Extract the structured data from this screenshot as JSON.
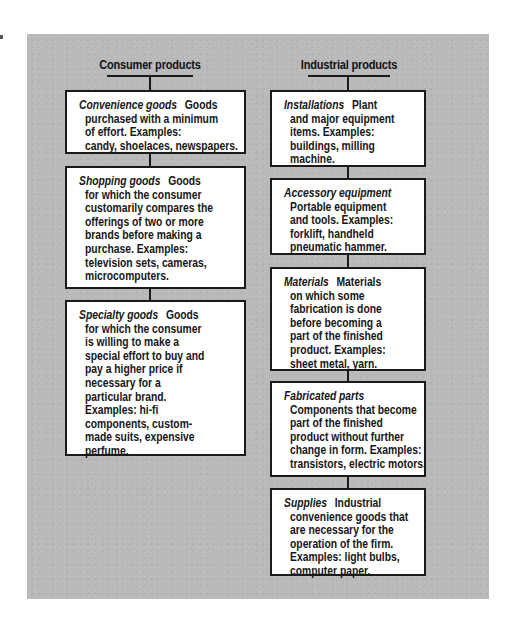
{
  "columns": [
    {
      "header": "Consumer products",
      "items": [
        {
          "term": "Convenience goods",
          "first_line_rest": "Goods",
          "lines": [
            "purchased with a minimum",
            "of effort. Examples:",
            "candy, shoelaces, newspapers."
          ]
        },
        {
          "term": "Shopping goods",
          "first_line_rest": "Goods",
          "lines": [
            "for which the consumer",
            "customarily compares the",
            "offerings of two or more",
            "brands before making a",
            "purchase. Examples:",
            "television sets, cameras,",
            "microcomputers."
          ]
        },
        {
          "term": "Specialty goods",
          "first_line_rest": "Goods",
          "lines": [
            "for which the consumer",
            "is willing to make a",
            "special effort to buy and",
            "pay a higher price if",
            "necessary for a",
            "particular brand.",
            "Examples: hi-fi",
            "components, custom-",
            "made suits, expensive",
            "perfume."
          ]
        }
      ]
    },
    {
      "header": "Industrial products",
      "items": [
        {
          "term": "Installations",
          "first_line_rest": "Plant",
          "lines": [
            "and major equipment",
            "items. Examples:",
            "buildings, milling",
            "machine."
          ]
        },
        {
          "term": "Accessory equipment",
          "first_line_rest": "",
          "lines": [
            "Portable equipment",
            "and tools. Examples:",
            "forklift, handheld",
            "pneumatic hammer."
          ]
        },
        {
          "term": "Materials",
          "first_line_rest": "Materials",
          "lines": [
            "on which some",
            "fabrication is done",
            "before becoming a",
            "part of the finished",
            "product. Examples:",
            "sheet metal, yarn."
          ]
        },
        {
          "term": "Fabricated parts",
          "first_line_rest": "",
          "lines": [
            "Components that become",
            "part of the finished",
            "product without further",
            "change in form. Examples:",
            "transistors, electric motors."
          ]
        },
        {
          "term": "Supplies",
          "first_line_rest": "Industrial",
          "lines": [
            "convenience goods that",
            "are necessary for the",
            "operation of the firm.",
            "Examples: light bulbs,",
            "computer paper."
          ]
        }
      ]
    }
  ],
  "colors": {
    "panel": "#b9b9b9",
    "box": "#ffffff",
    "border": "#1a1a1a",
    "text": "#161616"
  }
}
